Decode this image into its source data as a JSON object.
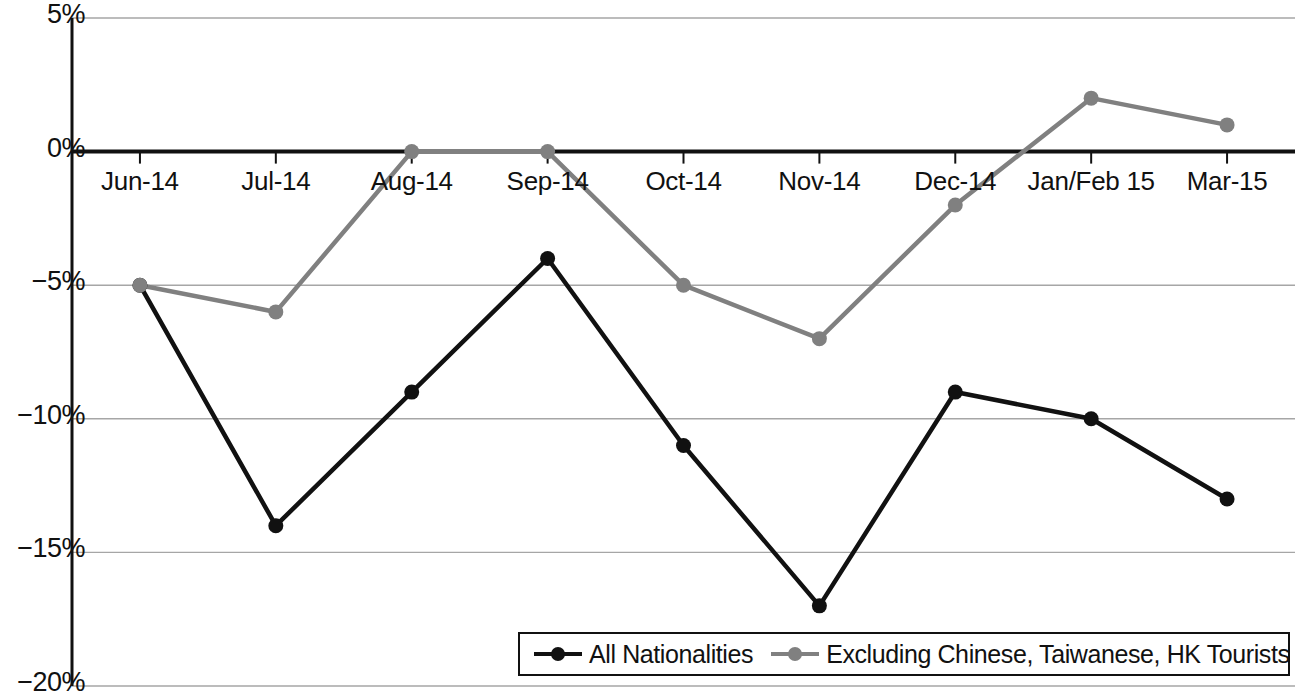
{
  "chart_data": {
    "type": "line",
    "title": "",
    "xlabel": "",
    "ylabel": "",
    "categories": [
      "Jun-14",
      "Jul-14",
      "Aug-14",
      "Sep-14",
      "Oct-14",
      "Nov-14",
      "Dec-14",
      "Jan/Feb 15",
      "Mar-15"
    ],
    "series": [
      {
        "name": "All Nationalities",
        "color": "#111111",
        "values": [
          -5,
          -14,
          -9,
          -4,
          -11,
          -17,
          -9,
          -10,
          -13
        ]
      },
      {
        "name": "Excluding Chinese, Taiwanese, HK Tourists",
        "color": "#808080",
        "values": [
          -5,
          -6,
          0,
          0,
          -5,
          -7,
          -2,
          2,
          1
        ]
      }
    ],
    "ylim": [
      -20,
      5
    ],
    "ytick_values": [
      5,
      0,
      -5,
      -10,
      -15,
      -20
    ],
    "ytick_labels": [
      "5%",
      "0%",
      "−5%",
      "−10%",
      "−15%",
      "−20%"
    ],
    "grid": true,
    "grid_axis": "y",
    "grid_color": "#A6A6A6",
    "zero_line_color": "#111111",
    "axis_color": "#111111",
    "legend_position": "bottom-right",
    "units": "percent"
  },
  "legend": {
    "entries": [
      {
        "label": "All Nationalities",
        "color": "#111111",
        "marker": "circle"
      },
      {
        "label": "Excluding Chinese, Taiwanese, HK Tourists",
        "color": "#808080",
        "marker": "circle"
      }
    ]
  },
  "axes": {
    "y_labels": [
      "5%",
      "0%",
      "−5%",
      "−10%",
      "−15%",
      "−20%"
    ],
    "x_labels": [
      "Jun-14",
      "Jul-14",
      "Aug-14",
      "Sep-14",
      "Oct-14",
      "Nov-14",
      "Dec-14",
      "Jan/Feb 15",
      "Mar-15"
    ]
  }
}
